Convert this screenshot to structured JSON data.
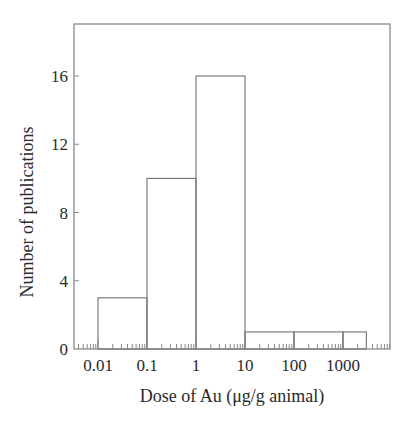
{
  "chart_data": {
    "type": "bar",
    "subtype": "histogram-step",
    "title": "",
    "xlabel": "Dose of Au (μg/g animal)",
    "ylabel": "Number of publications",
    "xscale": "log",
    "xlim": [
      0.0032,
      9500
    ],
    "ylim": [
      0,
      19
    ],
    "x_tick_labels": [
      "0.01",
      "0.1",
      "1",
      "10",
      "100",
      "1000"
    ],
    "x_ticks": [
      0.01,
      0.1,
      1,
      10,
      100,
      1000
    ],
    "y_tick_labels": [
      "0",
      "4",
      "8",
      "12",
      "16"
    ],
    "y_ticks": [
      0,
      4,
      8,
      12,
      16
    ],
    "grid": false,
    "legend": null,
    "bins": [
      {
        "from": 0.01,
        "to": 0.1,
        "value": 3
      },
      {
        "from": 0.1,
        "to": 1,
        "value": 10
      },
      {
        "from": 1,
        "to": 10,
        "value": 16
      },
      {
        "from": 10,
        "to": 100,
        "value": 1
      },
      {
        "from": 100,
        "to": 1000,
        "value": 1
      },
      {
        "from": 1000,
        "to": 3000,
        "value": 1
      }
    ],
    "categories": [
      "0.01–0.1",
      "0.1–1",
      "1–10",
      "10–100",
      "100–1000",
      "1000–3000"
    ],
    "values": [
      3,
      10,
      16,
      1,
      1,
      1
    ],
    "colors": {
      "line": "#707070",
      "frame": "#8a8a8a",
      "text": "#2a2a2a"
    }
  }
}
